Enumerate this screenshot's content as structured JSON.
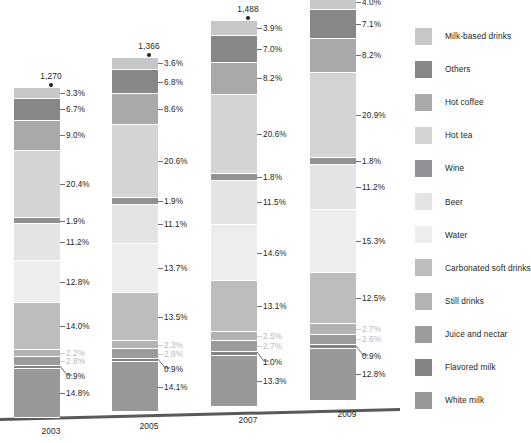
{
  "chart_data": {
    "type": "bar",
    "subtype": "stacked-percentage-column",
    "title": "",
    "xlabel": "",
    "ylabel": "",
    "grid": false,
    "legend_position": "right",
    "categories": [
      "2003",
      "2005",
      "2007",
      "2009"
    ],
    "totals": [
      "1,270",
      "1,366",
      "1,488",
      "1,567"
    ],
    "value_suffix": "%",
    "series": [
      {
        "name": "Milk-based drinks",
        "color": "#c6c7c9",
        "values": [
          3.3,
          3.6,
          3.9,
          4.0
        ]
      },
      {
        "name": "Others",
        "color": "#868789",
        "values": [
          6.7,
          6.8,
          7.0,
          7.1
        ]
      },
      {
        "name": "Hot coffee",
        "color": "#a8a9ab",
        "values": [
          9.0,
          8.6,
          8.2,
          8.2
        ]
      },
      {
        "name": "Hot tea",
        "color": "#d3d4d6",
        "values": [
          20.4,
          20.6,
          20.6,
          20.9
        ]
      },
      {
        "name": "Wine",
        "color": "#909194",
        "values": [
          1.9,
          1.9,
          1.8,
          1.8
        ]
      },
      {
        "name": "Beer",
        "color": "#e3e4e6",
        "values": [
          11.2,
          11.1,
          11.5,
          11.2
        ]
      },
      {
        "name": "Water",
        "color": "#eceded",
        "values": [
          12.8,
          13.7,
          14.6,
          15.3
        ]
      },
      {
        "name": "Carbonated soft drinks",
        "color": "#bcbdbf",
        "values": [
          14.0,
          13.5,
          13.1,
          12.5
        ]
      },
      {
        "name": "Still drinks",
        "color": "#b2b3b5",
        "values": [
          2.2,
          2.3,
          2.5,
          2.7
        ]
      },
      {
        "name": "Juice and nectar",
        "color": "#9a9b9d",
        "values": [
          2.8,
          2.8,
          2.7,
          2.6
        ]
      },
      {
        "name": "Flavored milk",
        "color": "#828385",
        "values": [
          0.9,
          0.9,
          1.0,
          0.9
        ]
      },
      {
        "name": "White milk",
        "color": "#97989a",
        "values": [
          14.8,
          14.1,
          13.3,
          12.8
        ]
      }
    ],
    "bar_labels": [
      [
        "3.3%",
        "6.7%",
        "9.0%",
        "20.4%",
        "1.9%",
        "11.2%",
        "12.8%",
        "14.0%",
        "2.2%",
        "2.8%",
        "0.9%",
        "14.8%"
      ],
      [
        "3.6%",
        "6.8%",
        "8.6%",
        "20.6%",
        "1.9%",
        "11.1%",
        "13.7%",
        "13.5%",
        "2.3%",
        "2.8%",
        "0.9%",
        "14.1%"
      ],
      [
        "3.9%",
        "7.0%",
        "8.2%",
        "20.6%",
        "1.8%",
        "11.5%",
        "14.6%",
        "13.1%",
        "2.5%",
        "2.7%",
        "1.0%",
        "13.3%"
      ],
      [
        "4.0%",
        "7.1%",
        "8.2%",
        "20.9%",
        "1.8%",
        "11.2%",
        "15.3%",
        "12.5%",
        "2.7%",
        "2.6%",
        "0.9%",
        "12.8%"
      ]
    ],
    "faint_label_indices": [
      8,
      9
    ],
    "angled_leader_index": 10
  },
  "legend": {
    "items": [
      {
        "label": "Milk-based drinks",
        "color": "#c6c7c9"
      },
      {
        "label": "Others",
        "color": "#868789"
      },
      {
        "label": "Hot coffee",
        "color": "#a8a9ab"
      },
      {
        "label": "Hot tea",
        "color": "#d3d4d6"
      },
      {
        "label": "Wine",
        "color": "#909194"
      },
      {
        "label": "Beer",
        "color": "#e3e4e6"
      },
      {
        "label": "Water",
        "color": "#eceded"
      },
      {
        "label": "Carbonated soft drinks",
        "color": "#bcbdbf"
      },
      {
        "label": "Still drinks",
        "color": "#b2b3b5"
      },
      {
        "label": "Juice and nectar",
        "color": "#9a9b9d"
      },
      {
        "label": "Flavored milk",
        "color": "#828385"
      },
      {
        "label": "White milk",
        "color": "#97989a"
      }
    ]
  },
  "axis": {
    "baseline_color": "#58595b"
  }
}
